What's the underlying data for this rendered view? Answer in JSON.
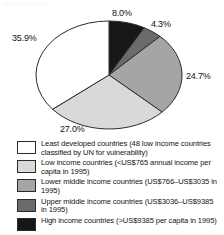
{
  "chart_data": {
    "type": "pie",
    "title": "",
    "subtitle": "",
    "xlabel": "",
    "ylabel": "",
    "legend_position": "bottom",
    "grid": false,
    "start_angle_deg": 0,
    "direction": "clockwise",
    "categories": [
      "High income countries (>US$9385 per capita in 1995)",
      "Upper middle income countries (US$3036–US$9385 in 1995)",
      "Lower middle income countries (US$766–US$3035 in 1995)",
      "Low income countries (<US$765 annual income per capita in 1995)",
      "Least developed countries (48 low income countries classified by UN for vulnerability)"
    ],
    "values": [
      8.0,
      4.3,
      24.7,
      27.0,
      35.9
    ],
    "value_labels": [
      "8.0%",
      "4.3%",
      "24.7%",
      "27.0%",
      "35.9%"
    ],
    "colors": [
      "#171717",
      "#6b6b6b",
      "#a5a5a5",
      "#d9d9d9",
      "#ffffff"
    ],
    "units": "percent"
  },
  "pie": {
    "slices": [
      {
        "label": "8.0%",
        "value": 8.0,
        "color": "#171717",
        "stroke": "#2b2b2b"
      },
      {
        "label": "4.3%",
        "value": 4.3,
        "color": "#6b6b6b",
        "stroke": "#2b2b2b"
      },
      {
        "label": "24.7%",
        "value": 24.7,
        "color": "#a5a5a5",
        "stroke": "#2b2b2b"
      },
      {
        "label": "27.0%",
        "value": 27.0,
        "color": "#d9d9d9",
        "stroke": "#2b2b2b"
      },
      {
        "label": "35.9%",
        "value": 35.9,
        "color": "#ffffff",
        "stroke": "#2b2b2b"
      }
    ],
    "labels": {
      "black": "8.0%",
      "dark_gray": "4.3%",
      "mid_gray": "24.7%",
      "light_gray": "27.0%",
      "white": "35.9%"
    }
  },
  "legend": {
    "items": [
      {
        "swatch_color": "#ffffff",
        "text": "Least developed countries (48 low income countries classified by UN for vulnerability)"
      },
      {
        "swatch_color": "#d9d9d9",
        "text": "Low income countries (<US$765 annual income per capita in 1995)"
      },
      {
        "swatch_color": "#a5a5a5",
        "text": "Lower middle income countries (US$766–US$3035 in 1995)"
      },
      {
        "swatch_color": "#6b6b6b",
        "text": "Upper middle income countries (US$3036–US$9385 in 1995)"
      },
      {
        "swatch_color": "#171717",
        "text": "High income countries (>US$9385 per capita in 1995)"
      }
    ]
  }
}
